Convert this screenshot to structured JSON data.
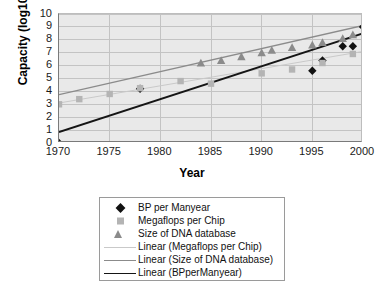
{
  "chart_data": {
    "type": "scatter",
    "title": "",
    "xlabel": "Year",
    "ylabel": "Capacity (log10)",
    "xlim": [
      1970,
      2000
    ],
    "ylim": [
      0,
      10
    ],
    "grid": true,
    "legend_position": "bottom",
    "xticks": [
      1970,
      1975,
      1980,
      1985,
      1990,
      1995,
      2000
    ],
    "yticks": [
      0,
      1,
      2,
      3,
      4,
      5,
      6,
      7,
      8,
      9,
      10
    ],
    "series": [
      {
        "name": "BP per Manyear",
        "marker": "diamond",
        "color": "#111111",
        "points": [
          {
            "x": 1970,
            "y": 0.0
          },
          {
            "x": 1978,
            "y": 4.2
          },
          {
            "x": 1995,
            "y": 5.6
          },
          {
            "x": 1996,
            "y": 6.4
          },
          {
            "x": 1998,
            "y": 7.5
          },
          {
            "x": 1999,
            "y": 7.5
          },
          {
            "x": 2000,
            "y": 9.0
          }
        ]
      },
      {
        "name": "Megaflops per Chip",
        "marker": "square",
        "color": "#b4b4b4",
        "points": [
          {
            "x": 1970,
            "y": 3.0
          },
          {
            "x": 1972,
            "y": 3.4
          },
          {
            "x": 1975,
            "y": 3.8
          },
          {
            "x": 1978,
            "y": 4.25
          },
          {
            "x": 1982,
            "y": 4.8
          },
          {
            "x": 1985,
            "y": 4.6
          },
          {
            "x": 1990,
            "y": 5.4
          },
          {
            "x": 1993,
            "y": 5.7
          },
          {
            "x": 1996,
            "y": 6.2
          },
          {
            "x": 1999,
            "y": 6.9
          }
        ]
      },
      {
        "name": "Size of DNA database",
        "marker": "triangle",
        "color": "#8b8b8b",
        "points": [
          {
            "x": 1984,
            "y": 6.2
          },
          {
            "x": 1986,
            "y": 6.4
          },
          {
            "x": 1988,
            "y": 6.7
          },
          {
            "x": 1990,
            "y": 7.0
          },
          {
            "x": 1991,
            "y": 7.2
          },
          {
            "x": 1993,
            "y": 7.4
          },
          {
            "x": 1995,
            "y": 7.6
          },
          {
            "x": 1996,
            "y": 7.8
          },
          {
            "x": 1998,
            "y": 8.1
          },
          {
            "x": 1999,
            "y": 8.4
          }
        ]
      }
    ],
    "trendlines": [
      {
        "name": "Linear (Megaflops per Chip)",
        "color": "#c9c9c9",
        "width": 1,
        "from": {
          "x": 1970,
          "y": 3.1
        },
        "to": {
          "x": 2000,
          "y": 7.1
        }
      },
      {
        "name": "Linear (Size of DNA database)",
        "color": "#8b8b8b",
        "width": 1.4,
        "from": {
          "x": 1970,
          "y": 3.75
        },
        "to": {
          "x": 2000,
          "y": 9.1
        }
      },
      {
        "name": "Linear (BPperManyear)",
        "color": "#151515",
        "width": 1.8,
        "from": {
          "x": 1970,
          "y": 0.85
        },
        "to": {
          "x": 2000,
          "y": 8.5
        }
      }
    ],
    "legend_entries": [
      {
        "label": "BP per Manyear",
        "kind": "marker",
        "marker": "diamond"
      },
      {
        "label": "Megaflops per Chip",
        "kind": "marker",
        "marker": "square"
      },
      {
        "label": "Size of DNA database",
        "kind": "marker",
        "marker": "triangle"
      },
      {
        "label": "Linear (Megaflops per Chip)",
        "kind": "line",
        "style": "a"
      },
      {
        "label": "Linear (Size of DNA database)",
        "kind": "line",
        "style": "b"
      },
      {
        "label": "Linear (BPperManyear)",
        "kind": "line",
        "style": "c"
      }
    ]
  }
}
